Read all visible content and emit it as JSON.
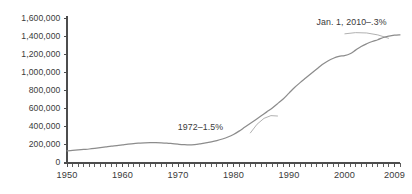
{
  "chart_data": {
    "type": "line",
    "title": "",
    "subtitle": "",
    "xlabel": "",
    "ylabel": "",
    "xlim": [
      1950,
      2010
    ],
    "ylim": [
      0,
      1600000
    ],
    "grid": false,
    "legend": null,
    "y_ticks": [
      {
        "value": 1600000,
        "label": "1,600,000"
      },
      {
        "value": 1400000,
        "label": "1,400,000"
      },
      {
        "value": 1200000,
        "label": "1,200,000"
      },
      {
        "value": 1000000,
        "label": "1,000,000"
      },
      {
        "value": 800000,
        "label": "800,000"
      },
      {
        "value": 600000,
        "label": "600,000"
      },
      {
        "value": 400000,
        "label": "400,000"
      },
      {
        "value": 200000,
        "label": "200,000"
      },
      {
        "value": 0,
        "label": "0"
      }
    ],
    "x_ticks": [
      {
        "value": 1950,
        "label": "1950"
      },
      {
        "value": 1960,
        "label": "1960"
      },
      {
        "value": 1970,
        "label": "1970"
      },
      {
        "value": 1980,
        "label": "1980"
      },
      {
        "value": 1990,
        "label": "1990"
      },
      {
        "value": 2000,
        "label": "2000"
      },
      {
        "value": 2009,
        "label": "2009"
      }
    ],
    "minor_tick_interval": 1,
    "series": [
      {
        "name": "value",
        "color": "#8c8c8c",
        "x": [
          1950,
          1951,
          1952,
          1953,
          1954,
          1955,
          1956,
          1957,
          1958,
          1959,
          1960,
          1961,
          1962,
          1963,
          1964,
          1965,
          1966,
          1967,
          1968,
          1969,
          1970,
          1971,
          1972,
          1973,
          1974,
          1975,
          1976,
          1977,
          1978,
          1979,
          1980,
          1981,
          1982,
          1983,
          1984,
          1985,
          1986,
          1987,
          1988,
          1989,
          1990,
          1991,
          1992,
          1993,
          1994,
          1995,
          1996,
          1997,
          1998,
          1999,
          2000,
          2001,
          2002,
          2003,
          2004,
          2005,
          2006,
          2007,
          2008,
          2009,
          2010
        ],
        "values": [
          135000,
          140000,
          145000,
          150000,
          155000,
          162000,
          170000,
          178000,
          186000,
          192000,
          200000,
          208000,
          215000,
          220000,
          224000,
          226000,
          226000,
          224000,
          220000,
          214000,
          208000,
          203000,
          200000,
          204000,
          212000,
          222000,
          234000,
          248000,
          266000,
          288000,
          316000,
          353000,
          395000,
          437000,
          480000,
          523000,
          566000,
          610000,
          660000,
          712000,
          774000,
          836000,
          890000,
          940000,
          990000,
          1040000,
          1090000,
          1130000,
          1160000,
          1180000,
          1190000,
          1210000,
          1250000,
          1290000,
          1320000,
          1345000,
          1365000,
          1390000,
          1405000,
          1415000,
          1420000
        ]
      }
    ],
    "annotations": [
      {
        "id": "annotation-1972",
        "text": "1972–1.5%",
        "x_label": 1975,
        "y_label": 390000,
        "leader_from": {
          "x": 1983,
          "y": 330000
        },
        "leader_to": {
          "x": 1988,
          "y": 520000
        }
      },
      {
        "id": "annotation-jan-2010",
        "text": "Jan. 1, 2010–.3%",
        "x_label": 2000,
        "y_label": 1545000,
        "leader_from": {
          "x": 2000,
          "y": 1430000
        },
        "leader_to": {
          "x": 2008,
          "y": 1380000
        }
      }
    ],
    "axis_color": "#4d4d4d",
    "line_color": "#8c8c8c",
    "text_color": "#3a3a3a",
    "background_color": "#ffffff"
  }
}
